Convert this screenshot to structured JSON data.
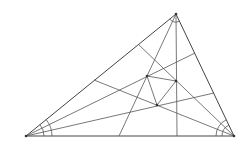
{
  "diagram": {
    "vertices": {
      "A": [
        26,
        136
      ],
      "B": [
        234,
        136
      ],
      "C": [
        176,
        14
      ]
    },
    "morley_points": {
      "P": [
        147,
        76
      ],
      "Q": [
        176,
        81
      ],
      "R": [
        157,
        105
      ]
    },
    "trisector_lines": [
      {
        "from": [
          26,
          136
        ],
        "to": [
          195,
          53
        ]
      },
      {
        "from": [
          26,
          136
        ],
        "to": [
          214,
          93
        ]
      },
      {
        "from": [
          234,
          136
        ],
        "to": [
          138,
          44
        ]
      },
      {
        "from": [
          234,
          136
        ],
        "to": [
          94,
          80
        ]
      },
      {
        "from": [
          176,
          14
        ],
        "to": [
          119,
          136
        ]
      },
      {
        "from": [
          176,
          14
        ],
        "to": [
          177,
          136
        ]
      }
    ],
    "morley_triangle_edges": [
      {
        "from": [
          147,
          76
        ],
        "to": [
          176,
          81
        ]
      },
      {
        "from": [
          176,
          81
        ],
        "to": [
          157,
          105
        ]
      },
      {
        "from": [
          157,
          105
        ],
        "to": [
          147,
          76
        ]
      }
    ],
    "angle_arcs": [
      {
        "vertex": "A",
        "radii": [
          18,
          26
        ]
      },
      {
        "vertex": "B",
        "radii": [
          12,
          18
        ]
      },
      {
        "vertex": "C",
        "radii": [
          8
        ]
      }
    ],
    "colors": {
      "stroke": "#444444",
      "background": "#ffffff"
    }
  }
}
